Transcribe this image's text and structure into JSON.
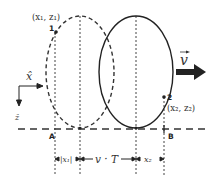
{
  "diagram": {
    "colors": {
      "stroke": "#222222",
      "dashed": "#333333",
      "arrow": "#222222",
      "background": "#ffffff"
    },
    "labels": {
      "point1_number": "1",
      "point1_coords": "(x₁, z₁)",
      "point2_number": "2",
      "point2_coords": "(x₂, z₂)",
      "velocity": "v⃗",
      "velocity_symbol": "v",
      "x_axis": "x̂",
      "z_axis": "ẑ",
      "point_a": "A",
      "point_b": "B",
      "dim_x1": "|x₁|",
      "dim_vt": "v · T",
      "dim_x2": "x₂"
    },
    "shapes": {
      "initial_ellipse": {
        "style": "dashed",
        "cx": 80,
        "cy": 72,
        "rx": 34,
        "ry": 56
      },
      "final_ellipse": {
        "style": "solid",
        "cx": 136,
        "cy": 72,
        "rx": 37,
        "ry": 56
      },
      "baseline": {
        "style": "dashed",
        "y": 129
      },
      "point1": {
        "x": 56,
        "y": 32
      },
      "point2": {
        "x": 164,
        "y": 97
      }
    }
  }
}
